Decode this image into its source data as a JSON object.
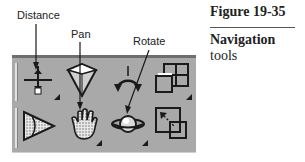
{
  "figure": {
    "number": "Figure 19-35",
    "title_bold": "Navigation",
    "title_rest": " tools"
  },
  "callouts": [
    {
      "label": "Distance",
      "target": "distance-tool"
    },
    {
      "label": "Pan",
      "target": "pan-tool"
    },
    {
      "label": "Rotate",
      "target": "rotate-tool"
    }
  ],
  "toolbar": {
    "background": "#a9a9a9",
    "rows": [
      [
        {
          "name": "distance",
          "icon": "distance-icon",
          "has_flyout": true
        },
        {
          "name": "zoom-box",
          "icon": "cone-zoom-icon",
          "has_flyout": false
        },
        {
          "name": "roll",
          "icon": "circular-arrows-icon",
          "has_flyout": false
        },
        {
          "name": "views",
          "icon": "multi-view-icon",
          "has_flyout": true
        }
      ],
      [
        {
          "name": "fly",
          "icon": "triangle-pointer-icon",
          "has_flyout": false
        },
        {
          "name": "pan",
          "icon": "hand-icon",
          "has_flyout": true
        },
        {
          "name": "rotate",
          "icon": "planet-icon",
          "has_flyout": true
        },
        {
          "name": "zoom-to-box",
          "icon": "zoom-box-icon",
          "has_flyout": false
        }
      ]
    ]
  }
}
